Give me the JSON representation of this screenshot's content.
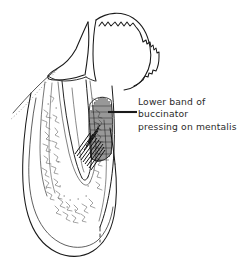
{
  "figure": {
    "type": "anatomical-line-drawing",
    "background_color": "#ffffff",
    "ink_color": "#1a1a1a",
    "text_color": "#2b2b2b",
    "width": 244,
    "height": 270
  },
  "annotation": {
    "lines": [
      "Lower band of",
      "buccinator",
      "pressing on mentalis"
    ],
    "full_text": "Lower band of buccinator pressing on mentalis",
    "leader_line": {
      "from_x": 108,
      "from_y": 112,
      "to_x": 137,
      "to_y": 112
    }
  },
  "structures": {
    "tooth_crown": "tooth-crown",
    "alveolar_crest": "scalloped-bone-crest",
    "tooth_root": "tooth-root",
    "trabecular_bone": "trabecular-bone-stipple",
    "muscle_band": "buccinator-muscle-hatching",
    "mucosa_line_left": "soft-tissue-contour-left",
    "mucosa_line_right": "soft-tissue-contour-right",
    "mandible_body": "mandible-body-outline"
  }
}
